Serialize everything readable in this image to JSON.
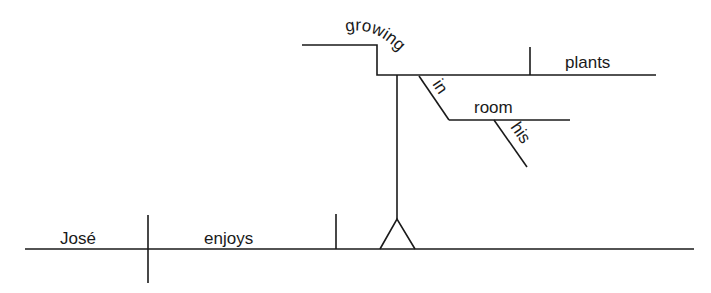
{
  "diagram": {
    "type": "sentence-diagram",
    "sentence": "José enjoys growing plants in his room",
    "words": {
      "subject": "José",
      "verb": "enjoys",
      "gerund": "growing",
      "gerund_object": "plants",
      "preposition": "in",
      "prep_object": "room",
      "modifier": "his"
    },
    "colors": {
      "line": "#1a1a1a",
      "background": "#ffffff"
    }
  }
}
